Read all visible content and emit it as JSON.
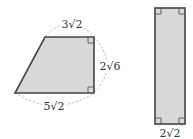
{
  "figure": {
    "trapezoid": {
      "top_label": "3√2",
      "right_label": "2√6",
      "bottom_label": "5√2",
      "fill": "#d8d8d8",
      "stroke": "#444444"
    },
    "rectangle": {
      "bottom_label": "2√2",
      "fill": "#d8d8d8",
      "stroke": "#444444"
    }
  }
}
